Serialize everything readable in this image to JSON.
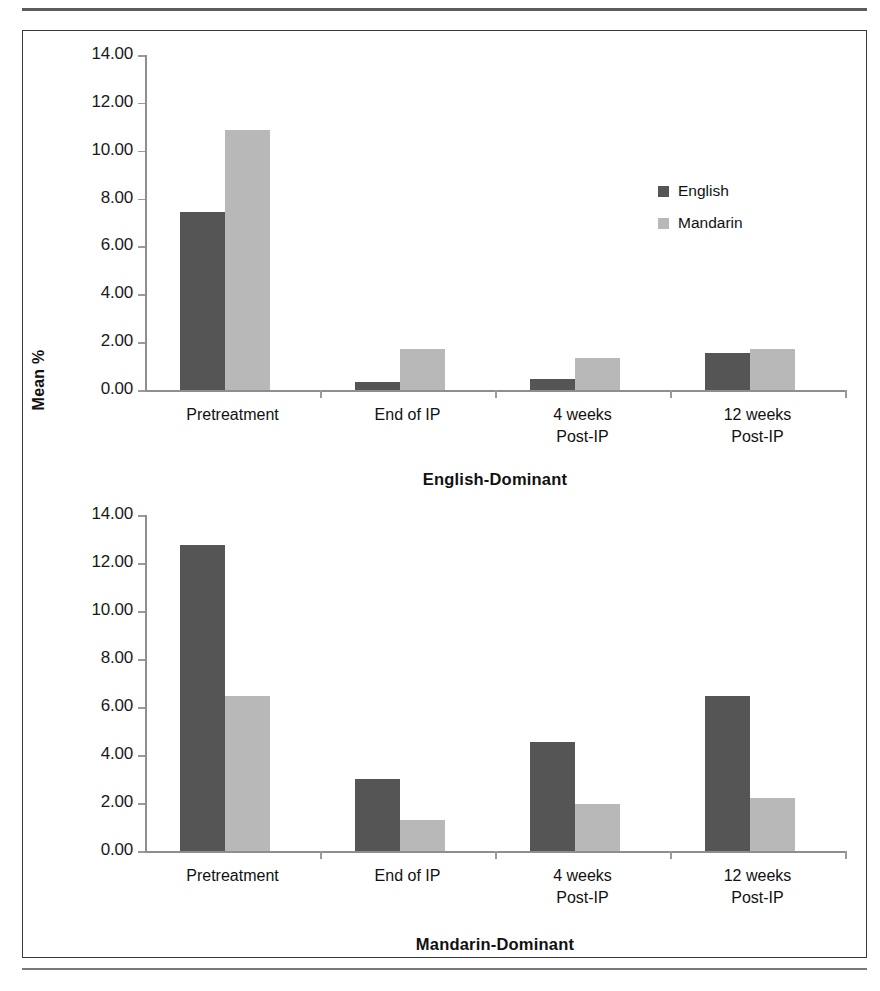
{
  "figure": {
    "y_axis_title": "Mean %",
    "legend": {
      "items": [
        {
          "label": "English",
          "color": "#555555"
        },
        {
          "label": "Mandarin",
          "color": "#b8b8b8"
        }
      ]
    }
  },
  "chart_data": [
    {
      "type": "bar",
      "title": "English-Dominant",
      "xlabel": "",
      "ylabel": "Mean %",
      "ylim": [
        0,
        14
      ],
      "yticks": [
        "0.00",
        "2.00",
        "4.00",
        "6.00",
        "8.00",
        "10.00",
        "12.00",
        "14.00"
      ],
      "grid": false,
      "legend_position": "inside-right",
      "categories": [
        "Pretreatment",
        "End of IP",
        "4 weeks\nPost-IP",
        "12 weeks\nPost-IP"
      ],
      "series": [
        {
          "name": "English",
          "color": "#555555",
          "values": [
            7.45,
            0.35,
            0.45,
            1.55
          ]
        },
        {
          "name": "Mandarin",
          "color": "#b8b8b8",
          "values": [
            10.85,
            1.7,
            1.35,
            1.7
          ]
        }
      ]
    },
    {
      "type": "bar",
      "title": "Mandarin-Dominant",
      "xlabel": "",
      "ylabel": "Mean %",
      "ylim": [
        0,
        14
      ],
      "yticks": [
        "0.00",
        "2.00",
        "4.00",
        "6.00",
        "8.00",
        "10.00",
        "12.00",
        "14.00"
      ],
      "grid": false,
      "legend_position": "none",
      "categories": [
        "Pretreatment",
        "End of IP",
        "4 weeks\nPost-IP",
        "12 weeks\nPost-IP"
      ],
      "series": [
        {
          "name": "English",
          "color": "#555555",
          "values": [
            12.75,
            3.0,
            4.55,
            6.45
          ]
        },
        {
          "name": "Mandarin",
          "color": "#b8b8b8",
          "values": [
            6.45,
            1.3,
            1.95,
            2.2
          ]
        }
      ]
    }
  ]
}
